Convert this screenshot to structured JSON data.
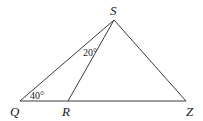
{
  "diagram": {
    "type": "geometry-triangle",
    "vertices": {
      "S": {
        "label": "S",
        "x": 114,
        "y": 20
      },
      "Q": {
        "label": "Q",
        "x": 20,
        "y": 101
      },
      "R": {
        "label": "R",
        "x": 68,
        "y": 101
      },
      "Z": {
        "label": "Z",
        "x": 186,
        "y": 101
      }
    },
    "segments": [
      {
        "from": "Q",
        "to": "S"
      },
      {
        "from": "S",
        "to": "Z"
      },
      {
        "from": "Q",
        "to": "Z"
      },
      {
        "from": "S",
        "to": "R"
      }
    ],
    "angles": [
      {
        "vertex": "Q",
        "label": "40°"
      },
      {
        "vertex": "S",
        "between": [
          "Q",
          "R"
        ],
        "label": "20°"
      }
    ]
  }
}
